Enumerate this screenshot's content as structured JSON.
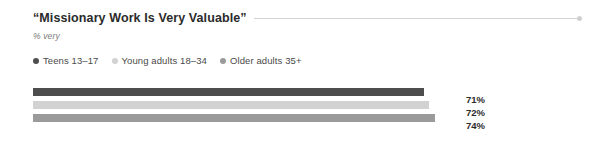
{
  "chart": {
    "title": "“Missionary Work Is Very Valuable”",
    "subtitle": "% very",
    "end_marker": "rule-end-dot"
  },
  "legend": {
    "items": [
      {
        "label": "Teens 13–17",
        "color": "#4d4d4d",
        "dot": "legend-dot-teens"
      },
      {
        "label": "Young adults 18–34",
        "color": "#d2d2d2",
        "dot": "legend-dot-young-adults"
      },
      {
        "label": "Older adults 35+",
        "color": "#9a9a9a",
        "dot": "legend-dot-older-adults"
      }
    ]
  },
  "bars": [
    {
      "label": "Teens 13–17",
      "value_label": "71%",
      "value": 71,
      "color": "#4d4d4d",
      "width_px": 391
    },
    {
      "label": "Young adults 18–34",
      "value_label": "72%",
      "value": 72,
      "color": "#d2d2d2",
      "width_px": 396
    },
    {
      "label": "Older adults 35+",
      "value_label": "74%",
      "value": 74,
      "color": "#9a9a9a",
      "width_px": 402
    }
  ],
  "chart_data": {
    "type": "bar",
    "orientation": "horizontal",
    "title": "“Missionary Work Is Very Valuable”",
    "subtitle": "% very",
    "xlabel": "",
    "ylabel": "",
    "categories": [
      "Teens 13–17",
      "Young adults 18–34",
      "Older adults 35+"
    ],
    "values": [
      71,
      72,
      74
    ],
    "value_labels": [
      "71%",
      "72%",
      "74%"
    ],
    "unit": "%",
    "xlim": [
      0,
      100
    ],
    "grid": false,
    "legend_position": "top-left",
    "series": [
      {
        "name": "% very",
        "values": [
          71,
          72,
          74
        ]
      }
    ],
    "colors": [
      "#4d4d4d",
      "#d2d2d2",
      "#9a9a9a"
    ]
  },
  "colors": {
    "background": "#ffffff",
    "title_text": "#2b2b2b",
    "subtitle_text": "#7a7a7a",
    "legend_text": "#4a4a4a",
    "rule": "#d3d3d3",
    "value_text": "#2b2b2b"
  }
}
